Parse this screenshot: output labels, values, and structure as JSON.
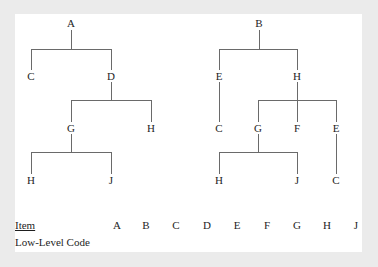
{
  "diagram": {
    "line_color": "#6a6a6a",
    "text_color": "#1e1e1e",
    "background": "#ffffff",
    "trees": [
      {
        "root": "A",
        "nodes": [
          {
            "id": "L_A",
            "label": "A",
            "x": 71,
            "y": 23
          },
          {
            "id": "L_C",
            "label": "C",
            "x": 31,
            "y": 76
          },
          {
            "id": "L_D",
            "label": "D",
            "x": 111,
            "y": 76
          },
          {
            "id": "L_G",
            "label": "G",
            "x": 71,
            "y": 128
          },
          {
            "id": "L_H1",
            "label": "H",
            "x": 151,
            "y": 128
          },
          {
            "id": "L_H2",
            "label": "H",
            "x": 31,
            "y": 180
          },
          {
            "id": "L_J",
            "label": "J",
            "x": 111,
            "y": 180
          }
        ],
        "edges": [
          [
            "A",
            "C"
          ],
          [
            "A",
            "D"
          ],
          [
            "D",
            "G"
          ],
          [
            "D",
            "H"
          ],
          [
            "G",
            "H"
          ],
          [
            "G",
            "J"
          ]
        ]
      },
      {
        "root": "B",
        "nodes": [
          {
            "id": "R_B",
            "label": "B",
            "x": 259,
            "y": 23
          },
          {
            "id": "R_E1",
            "label": "E",
            "x": 219,
            "y": 76
          },
          {
            "id": "R_H1",
            "label": "H",
            "x": 297,
            "y": 76
          },
          {
            "id": "R_C1",
            "label": "C",
            "x": 219,
            "y": 128
          },
          {
            "id": "R_G",
            "label": "G",
            "x": 258,
            "y": 128
          },
          {
            "id": "R_F",
            "label": "F",
            "x": 297,
            "y": 128
          },
          {
            "id": "R_E2",
            "label": "E",
            "x": 336,
            "y": 128
          },
          {
            "id": "R_H2",
            "label": "H",
            "x": 219,
            "y": 180
          },
          {
            "id": "R_J",
            "label": "J",
            "x": 297,
            "y": 180
          },
          {
            "id": "R_C2",
            "label": "C",
            "x": 336,
            "y": 180
          }
        ],
        "edges": [
          [
            "B",
            "E"
          ],
          [
            "B",
            "H"
          ],
          [
            "E",
            "C"
          ],
          [
            "H",
            "G"
          ],
          [
            "H",
            "F"
          ],
          [
            "H",
            "E"
          ],
          [
            "G",
            "H"
          ],
          [
            "G",
            "J"
          ],
          [
            "E",
            "C"
          ]
        ]
      }
    ]
  },
  "table": {
    "item_label": "Item",
    "code_label": "Low-Level Code",
    "items": [
      {
        "label": "A",
        "x": 117
      },
      {
        "label": "B",
        "x": 146
      },
      {
        "label": "C",
        "x": 176
      },
      {
        "label": "D",
        "x": 207
      },
      {
        "label": "E",
        "x": 237
      },
      {
        "label": "F",
        "x": 267
      },
      {
        "label": "G",
        "x": 297
      },
      {
        "label": "H",
        "x": 327
      },
      {
        "label": "J",
        "x": 356
      }
    ],
    "codes": [
      "",
      "",
      "",
      "",
      "",
      "",
      "",
      "",
      ""
    ]
  }
}
